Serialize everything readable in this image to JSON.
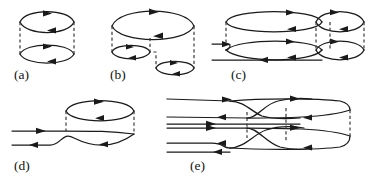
{
  "figure": {
    "width": 369,
    "height": 181,
    "background_color": "#ffffff",
    "line_color": "#1a1a1a",
    "dashed_color": "#3a3a3a"
  },
  "panels": [
    {
      "id": "a",
      "label": "(a)",
      "label_x": 14,
      "label_y": 79,
      "loops": 2,
      "dashed_verticals": 2,
      "arrowheads": 4
    },
    {
      "id": "b",
      "label": "(b)",
      "label_x": 110,
      "label_y": 79,
      "loops": 3,
      "dashed_verticals": 3,
      "arrowheads": 6
    },
    {
      "id": "c",
      "label": "(c)",
      "label_x": 231,
      "label_y": 79,
      "loops": 4,
      "dashed_verticals": 4,
      "arrowheads": 10
    },
    {
      "id": "d",
      "label": "(d)",
      "label_x": 14,
      "label_y": 170,
      "loops": 1,
      "dashed_verticals": 2,
      "arrowheads": 5
    },
    {
      "id": "e",
      "label": "(e)",
      "label_x": 190,
      "label_y": 170,
      "loops": 2,
      "dashed_verticals": 3,
      "arrowheads": 12
    }
  ]
}
